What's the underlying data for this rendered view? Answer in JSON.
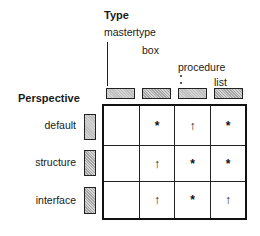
{
  "diagram": {
    "column_axis_title": "Type",
    "row_axis_title": "Perspective",
    "columns": [
      {
        "label": "mastertype"
      },
      {
        "label": "box"
      },
      {
        "label": "procedure"
      },
      {
        "label": "list"
      }
    ],
    "rows": [
      {
        "label": "default",
        "cells": [
          "",
          "*",
          "↑",
          "*"
        ]
      },
      {
        "label": "structure",
        "cells": [
          "",
          "↑",
          "*",
          "*"
        ]
      },
      {
        "label": "interface",
        "cells": [
          "",
          "↑",
          "*",
          "↑"
        ]
      }
    ],
    "symbols": {
      "star": "*",
      "up_arrow": "↑"
    }
  }
}
